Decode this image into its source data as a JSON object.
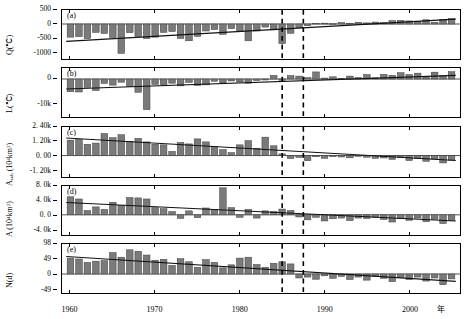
{
  "figure": {
    "title": "",
    "xlabel_unit": "年",
    "n_panels": 5,
    "x_range": [
      1959.0,
      2006.0
    ],
    "x_ticks": [
      1960,
      1970,
      1980,
      1990,
      2000
    ],
    "x_tick_labels": [
      "1960",
      "1970",
      "1980",
      "1990",
      "2000"
    ],
    "vlines": [
      1985.0,
      1987.5
    ],
    "vline_style": "dashed",
    "bar_fill": "#7a7a7a",
    "bar_edge": "#3a3a3a",
    "trend_color": "#111111",
    "frame_color": "#000000",
    "background": "#ffffff"
  },
  "chart_data": [
    {
      "type": "bar",
      "panel": "(a)",
      "ylabel": "Q(°C)",
      "ylim": [
        -1250,
        500
      ],
      "yticks": [
        500,
        0,
        -500,
        -1000
      ],
      "ytick_labels": [
        "500",
        "0",
        "-500",
        "-1000"
      ],
      "xlabel": "",
      "grid": false,
      "x": [
        1960,
        1961,
        1962,
        1963,
        1964,
        1965,
        1966,
        1967,
        1968,
        1969,
        1970,
        1971,
        1972,
        1973,
        1974,
        1975,
        1976,
        1977,
        1978,
        1979,
        1980,
        1981,
        1982,
        1983,
        1984,
        1985,
        1986,
        1987,
        1988,
        1989,
        1990,
        1991,
        1992,
        1993,
        1994,
        1995,
        1996,
        1997,
        1998,
        1999,
        2000,
        2001,
        2002,
        2003,
        2004,
        2005
      ],
      "values": [
        -470,
        -450,
        -520,
        -300,
        -340,
        -480,
        -1050,
        -310,
        -440,
        -520,
        -470,
        -300,
        -270,
        -520,
        -600,
        -440,
        -250,
        -200,
        -370,
        -170,
        -260,
        -600,
        -250,
        -110,
        -210,
        -700,
        -330,
        -130,
        -60,
        20,
        30,
        10,
        50,
        20,
        60,
        40,
        70,
        50,
        120,
        130,
        110,
        90,
        150,
        60,
        170,
        190
      ],
      "series_trend": {
        "name": "linear trend",
        "x": [
          1959.5,
          2005.5
        ],
        "y": [
          -620,
          175
        ]
      }
    },
    {
      "type": "bar",
      "panel": "(b)",
      "ylabel": "L(°C)",
      "ylim": [
        -15500,
        4500
      ],
      "yticks": [
        0,
        -10000
      ],
      "ytick_labels": [
        "0",
        "-10k"
      ],
      "xlabel": "",
      "grid": false,
      "x": [
        1960,
        1961,
        1962,
        1963,
        1964,
        1965,
        1966,
        1967,
        1968,
        1969,
        1970,
        1971,
        1972,
        1973,
        1974,
        1975,
        1976,
        1977,
        1978,
        1979,
        1980,
        1981,
        1982,
        1983,
        1984,
        1985,
        1986,
        1987,
        1988,
        1989,
        1990,
        1991,
        1992,
        1993,
        1994,
        1995,
        1996,
        1997,
        1998,
        1999,
        2000,
        2001,
        2002,
        2003,
        2004,
        2005
      ],
      "values": [
        -5200,
        -5300,
        -3400,
        -4700,
        -1800,
        -2500,
        -1300,
        -3000,
        -5400,
        -12500,
        -2200,
        -2300,
        -1700,
        -2800,
        -1400,
        -2600,
        -2400,
        -900,
        -1500,
        -800,
        -1200,
        -1700,
        -600,
        -400,
        1500,
        -500,
        1400,
        1200,
        600,
        2900,
        400,
        900,
        300,
        1200,
        600,
        1800,
        500,
        1900,
        1500,
        2600,
        1800,
        2400,
        700,
        2800,
        1400,
        3000
      ],
      "series_trend": {
        "name": "linear trend",
        "x": [
          1959.5,
          2005.5
        ],
        "y": [
          -4100,
          1500
        ]
      }
    },
    {
      "type": "bar",
      "panel": "(c)",
      "ylabel": "A_sub (10⁴km²)",
      "ylim": [
        -1800,
        2400
      ],
      "yticks": [
        2400,
        1200,
        0,
        -1200
      ],
      "ytick_labels": [
        "2. 40k",
        "1. 20k",
        "0. 00",
        "-1. 20k"
      ],
      "xlabel": "",
      "grid": false,
      "x": [
        1960,
        1961,
        1962,
        1963,
        1964,
        1965,
        1966,
        1967,
        1968,
        1969,
        1970,
        1971,
        1972,
        1973,
        1974,
        1975,
        1976,
        1977,
        1978,
        1979,
        1980,
        1981,
        1982,
        1983,
        1984,
        1985,
        1986,
        1987,
        1988,
        1989,
        1990,
        1991,
        1992,
        1993,
        1994,
        1995,
        1996,
        1997,
        1998,
        1999,
        2000,
        2001,
        2002,
        2003,
        2004,
        2005
      ],
      "values": [
        1300,
        1350,
        950,
        1050,
        1850,
        1500,
        1750,
        1200,
        1450,
        1150,
        950,
        900,
        350,
        1100,
        980,
        1400,
        1150,
        750,
        500,
        250,
        900,
        1250,
        620,
        1550,
        820,
        140,
        -250,
        -160,
        -430,
        -100,
        -230,
        -90,
        -120,
        -190,
        -60,
        -140,
        -230,
        -200,
        -320,
        -170,
        -420,
        -250,
        -480,
        -300,
        -620,
        -380
      ],
      "series_trend": {
        "name": "linear trend",
        "x": [
          1959.5,
          2005.5
        ],
        "y": [
          1480,
          -420
        ]
      }
    },
    {
      "type": "bar",
      "panel": "(d)",
      "ylabel": "A (10⁴km²)",
      "ylim": [
        -5600,
        8000
      ],
      "yticks": [
        8000,
        4000,
        0,
        -4000
      ],
      "ytick_labels": [
        "8. 0k",
        "4. 0k",
        "0. 0",
        "-4. 0k"
      ],
      "xlabel": "",
      "grid": false,
      "x": [
        1960,
        1961,
        1962,
        1963,
        1964,
        1965,
        1966,
        1967,
        1968,
        1969,
        1970,
        1971,
        1972,
        1973,
        1974,
        1975,
        1976,
        1977,
        1978,
        1979,
        1980,
        1981,
        1982,
        1983,
        1984,
        1985,
        1986,
        1987,
        1988,
        1989,
        1990,
        1991,
        1992,
        1993,
        1994,
        1995,
        1996,
        1997,
        1998,
        1999,
        2000,
        2001,
        2002,
        2003,
        2004,
        2005
      ],
      "values": [
        5000,
        4400,
        1200,
        2200,
        1500,
        3500,
        2600,
        4800,
        4700,
        4400,
        2000,
        1700,
        900,
        -1000,
        1100,
        -800,
        1900,
        1500,
        7500,
        2000,
        -700,
        1500,
        -900,
        1100,
        900,
        1600,
        1200,
        -600,
        -1400,
        -700,
        -1700,
        -1100,
        -900,
        -1600,
        -900,
        -1000,
        -700,
        -1300,
        -2000,
        -1100,
        -1500,
        -900,
        -1900,
        -1200,
        -2400,
        -1500
      ],
      "series_trend": {
        "name": "linear trend",
        "x": [
          1959.5,
          2005.5
        ],
        "y": [
          3400,
          -1700
        ]
      }
    },
    {
      "type": "bar",
      "panel": "(e)",
      "ylabel": "N(d)",
      "ylim": [
        -62,
        98
      ],
      "yticks": [
        98,
        49,
        0,
        -49
      ],
      "ytick_labels": [
        "98",
        "49",
        "0",
        "-49"
      ],
      "xlabel": "",
      "grid": false,
      "x": [
        1960,
        1961,
        1962,
        1963,
        1964,
        1965,
        1966,
        1967,
        1968,
        1969,
        1970,
        1971,
        1972,
        1973,
        1974,
        1975,
        1976,
        1977,
        1978,
        1979,
        1980,
        1981,
        1982,
        1983,
        1984,
        1985,
        1986,
        1987,
        1988,
        1989,
        1990,
        1991,
        1992,
        1993,
        1994,
        1995,
        1996,
        1997,
        1998,
        1999,
        2000,
        2001,
        2002,
        2003,
        2004,
        2005
      ],
      "values": [
        52,
        49,
        38,
        42,
        44,
        70,
        55,
        79,
        74,
        62,
        45,
        48,
        28,
        50,
        40,
        22,
        47,
        38,
        20,
        30,
        52,
        55,
        31,
        22,
        35,
        40,
        33,
        -13,
        -10,
        -17,
        -6,
        -14,
        -8,
        -18,
        -10,
        -20,
        -8,
        -14,
        -25,
        -11,
        -18,
        -10,
        -23,
        -13,
        -35,
        -16
      ],
      "series_trend": {
        "name": "linear trend",
        "x": [
          1959.5,
          2005.5
        ],
        "y": [
          57,
          -24
        ]
      }
    }
  ]
}
